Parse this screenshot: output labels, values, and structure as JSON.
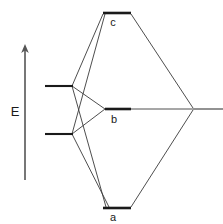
{
  "figure": {
    "type": "energy-level-correlation-diagram",
    "width": 223,
    "height": 224,
    "background_color": "#ffffff",
    "line_color": "#333333",
    "level_color": "#1a1a1a",
    "text_color": "#1a1a1a"
  },
  "axis": {
    "label": "E",
    "label_x": 15,
    "label_y": 115,
    "orientation": "vertical",
    "arrow_direction": "up",
    "x": 25,
    "y_top": 46,
    "y_bottom": 180
  },
  "levels": {
    "left": [
      {
        "name": "left-upper-level",
        "x1": 45,
        "x2": 72,
        "y": 86,
        "label": ""
      },
      {
        "name": "left-lower-level",
        "x1": 45,
        "x2": 134,
        "y": 134,
        "label": ""
      }
    ],
    "center": [
      {
        "name": "level-c",
        "label": "c",
        "x1": 103,
        "x2": 131,
        "y": 13,
        "label_x": 113,
        "label_y": 26
      },
      {
        "name": "level-b",
        "label": "b",
        "x1": 105,
        "x2": 131,
        "y": 109,
        "label_x": 114,
        "label_y": 123
      },
      {
        "name": "level-a",
        "label": "a",
        "x1": 103,
        "x2": 131,
        "y": 208,
        "label_x": 113,
        "label_y": 221
      }
    ],
    "right": [
      {
        "name": "right-level",
        "x1": 193,
        "x2": 223,
        "y": 109,
        "label": ""
      }
    ]
  },
  "vertices": {
    "left_upper": {
      "x": 72,
      "y": 86
    },
    "left_lower": {
      "x": 72,
      "y": 134
    },
    "right_node": {
      "x": 193,
      "y": 109
    }
  },
  "correlation_lines": [
    {
      "name": "left-upper-to-c",
      "x1": 72,
      "y1": 86,
      "x2": 103,
      "y2": 14
    },
    {
      "name": "left-lower-to-c",
      "x1": 72,
      "y1": 134,
      "x2": 104,
      "y2": 14
    },
    {
      "name": "left-upper-to-b",
      "x1": 72,
      "y1": 86,
      "x2": 105,
      "y2": 109
    },
    {
      "name": "left-lower-to-b",
      "x1": 72,
      "y1": 134,
      "x2": 105,
      "y2": 109
    },
    {
      "name": "left-upper-to-a",
      "x1": 72,
      "y1": 86,
      "x2": 106,
      "y2": 207
    },
    {
      "name": "left-lower-to-a",
      "x1": 72,
      "y1": 134,
      "x2": 108,
      "y2": 207
    },
    {
      "name": "c-to-right-node",
      "x1": 131,
      "y1": 14,
      "x2": 193,
      "y2": 108
    },
    {
      "name": "b-to-right-node",
      "x1": 131,
      "y1": 109,
      "x2": 193,
      "y2": 109
    },
    {
      "name": "a-to-right-node",
      "x1": 131,
      "y1": 207,
      "x2": 193,
      "y2": 110
    }
  ],
  "labels": {
    "energy_axis": "E",
    "level_c": "c",
    "level_b": "b",
    "level_a": "a"
  }
}
